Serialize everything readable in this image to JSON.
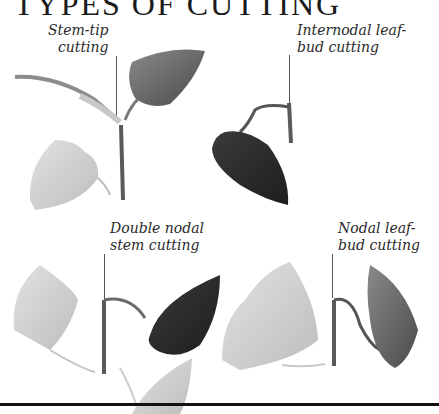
{
  "title": "TYPES OF CUTTING",
  "labels": {
    "stem_tip": {
      "line1": "Stem-tip",
      "line2": "cutting"
    },
    "internodal": {
      "line1": "Internodal leaf-",
      "line2": "bud cutting"
    },
    "double_nodal": {
      "line1": "Double nodal",
      "line2": "stem cutting"
    },
    "nodal": {
      "line1": "Nodal leaf-",
      "line2": "bud cutting"
    }
  },
  "colors": {
    "ink": "#1a1a1a",
    "dark_leaf": "#2e2e2e",
    "mid_leaf": "#6a6a6a",
    "pale_leaf": "#cfcfcf",
    "stem": "#5a5a5a"
  }
}
